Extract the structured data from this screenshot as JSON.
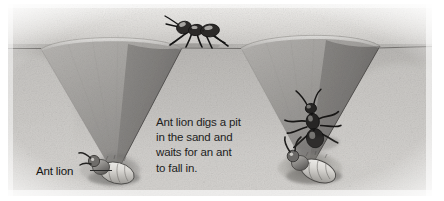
{
  "illustration": {
    "title": "Ant lion digs a pit in the sand and waits for an ant to fall in",
    "subject": "ant-lion-pit-trap",
    "medium": "pencil-illustration",
    "background_color": "#ffffff",
    "sand_color": "#a9a7a4",
    "sand_shadow_color": "#6f6d6b",
    "ink_color": "#1d1d1d"
  },
  "caption": {
    "line1": "Ant lion digs a pit",
    "line2": "in the sand and",
    "line3": "waits for an ant",
    "line4": "to fall in."
  },
  "labels": {
    "ant_lion": "Ant lion"
  },
  "scene_objects": {
    "ground_label": "sand surface",
    "left_pit_label": "empty ant lion pit",
    "right_pit_label": "ant lion pit with falling ant",
    "walking_ant_label": "ant walking on sand ridge",
    "falling_ant_label": "ant sliding down pit wall",
    "left_larva_label": "ant lion larva at pit bottom",
    "right_larva_label": "ant lion larva seizing ant"
  }
}
